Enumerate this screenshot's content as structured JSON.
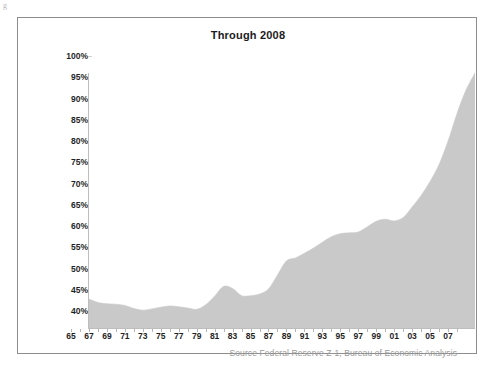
{
  "figure": {
    "corner_mark": "g",
    "title": "Through  2008",
    "source_note": "Source  Federal Reserve Z-1, Bureau of Economic Analysis",
    "frame_color": "#8d8d8d",
    "area_fill_color": "#c9c9c9",
    "axis_color": "#bdbdbd",
    "text_color": "#1f1f1f",
    "source_text_color": "#9a9a9a"
  },
  "chart_data": {
    "type": "area",
    "title": "Through  2008",
    "xlabel": "",
    "ylabel": "",
    "ylim": [
      40,
      100
    ],
    "ytick_format": "percent",
    "grid": false,
    "legend": null,
    "annotations": [
      "Source  Federal Reserve Z-1, Bureau of Economic Analysis"
    ],
    "ytick_labels": [
      "100%",
      "95%",
      "90%",
      "85%",
      "80%",
      "75%",
      "70%",
      "65%",
      "60%",
      "55%",
      "50%",
      "45%",
      "40%"
    ],
    "ytick_values": [
      100,
      95,
      90,
      85,
      80,
      75,
      70,
      65,
      60,
      55,
      50,
      45,
      40
    ],
    "xtick_labels": [
      "65",
      "67",
      "69",
      "71",
      "73",
      "75",
      "77",
      "79",
      "81",
      "83",
      "85",
      "87",
      "89",
      "91",
      "93",
      "95",
      "97",
      "99",
      "01",
      "03",
      "05",
      "07"
    ],
    "xtick_values": [
      1965,
      1967,
      1969,
      1971,
      1973,
      1975,
      1977,
      1979,
      1981,
      1983,
      1985,
      1987,
      1989,
      1991,
      1993,
      1995,
      1997,
      1999,
      2001,
      2003,
      2005,
      2007
    ],
    "xlim": [
      1965,
      2008
    ],
    "x": [
      1965,
      1966,
      1967,
      1968,
      1969,
      1970,
      1971,
      1972,
      1973,
      1974,
      1975,
      1976,
      1977,
      1978,
      1979,
      1980,
      1981,
      1982,
      1983,
      1984,
      1985,
      1986,
      1987,
      1988,
      1989,
      1990,
      1991,
      1992,
      1993,
      1994,
      1995,
      1996,
      1997,
      1998,
      1999,
      2000,
      2001,
      2002,
      2003,
      2004,
      2005,
      2006,
      2007,
      2008
    ],
    "values": [
      46.8,
      46.0,
      45.7,
      45.6,
      45.3,
      44.6,
      44.2,
      44.5,
      44.9,
      45.2,
      45.0,
      44.7,
      44.4,
      45.5,
      47.5,
      49.8,
      49.3,
      47.6,
      47.6,
      48.0,
      49.2,
      52.5,
      55.8,
      56.5,
      57.6,
      58.8,
      60.2,
      61.5,
      62.2,
      62.4,
      62.6,
      63.8,
      65.1,
      65.6,
      65.2,
      66.0,
      68.5,
      71.2,
      74.5,
      78.5,
      84.0,
      90.5,
      96.0,
      100.0
    ],
    "series": [
      {
        "name": "Through 2008",
        "values": [
          46.8,
          46.0,
          45.7,
          45.6,
          45.3,
          44.6,
          44.2,
          44.5,
          44.9,
          45.2,
          45.0,
          44.7,
          44.4,
          45.5,
          47.5,
          49.8,
          49.3,
          47.6,
          47.6,
          48.0,
          49.2,
          52.5,
          55.8,
          56.5,
          57.6,
          58.8,
          60.2,
          61.5,
          62.2,
          62.4,
          62.6,
          63.8,
          65.1,
          65.6,
          65.2,
          66.0,
          68.5,
          71.2,
          74.5,
          78.5,
          84.0,
          90.5,
          96.0,
          100.0
        ]
      }
    ]
  }
}
